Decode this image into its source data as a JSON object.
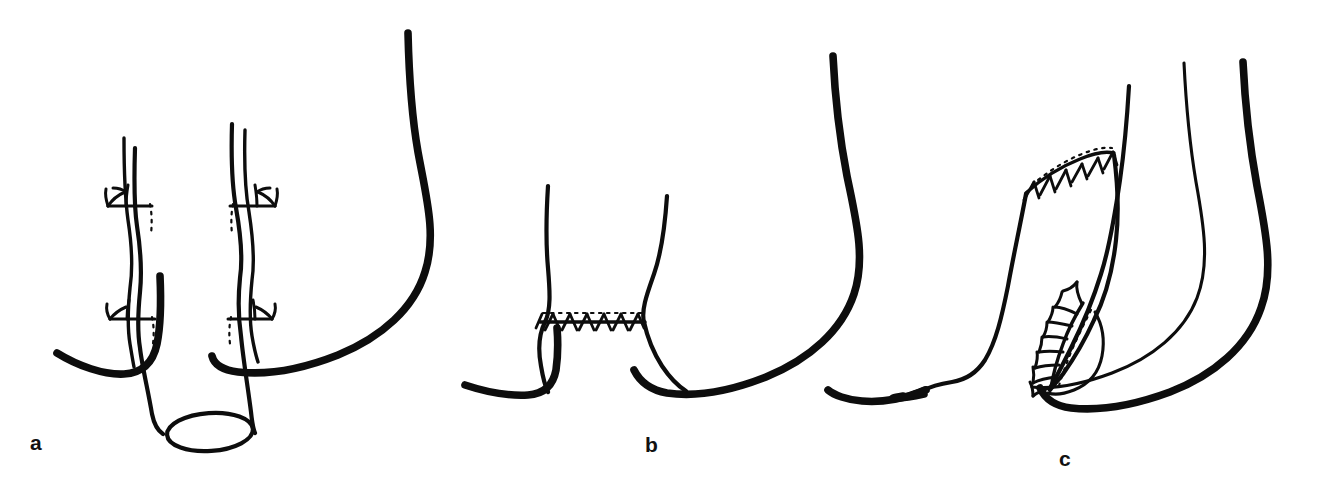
{
  "figure": {
    "background_color": "#ffffff",
    "ink_color": "#0d0d0d",
    "width": 1317,
    "height": 490,
    "style": "black ink line drawing, no shading"
  },
  "panels": [
    {
      "id": "a",
      "label": "a",
      "label_x": 30,
      "label_y": 450,
      "caption_stage": "Mobilised tube with divided vascular pedicles and open cut end",
      "elements": [
        "open-cut-end-ellipse",
        "tube-left-wall",
        "tube-right-wall",
        "vessel-left-long",
        "vessel-right-long",
        "ligature-upper-left",
        "ligature-upper-right",
        "ligature-lower-left",
        "ligature-lower-right",
        "thick-organ-contour-left",
        "thick-organ-contour-right"
      ]
    },
    {
      "id": "b",
      "label": "b",
      "label_x": 645,
      "label_y": 452,
      "caption_stage": "Closed stump joined by transverse running suture line",
      "elements": [
        "limb-left-wall",
        "limb-right-wall",
        "transverse-suture-line",
        "thick-organ-contour-left",
        "thick-organ-contour-right"
      ]
    },
    {
      "id": "c",
      "label": "c",
      "label_x": 1059,
      "label_y": 466,
      "caption_stage": "Completed pouch with oblique suture line and preserved vascular arcade",
      "elements": [
        "pouch-outer-wall",
        "pouch-inner-wall",
        "oblique-suture-line",
        "vascular-arcade",
        "arcade-branches",
        "thin-organ-contour",
        "thick-organ-contour"
      ]
    }
  ],
  "suture_lines": [
    {
      "name": "transverse-suture-line",
      "panel": "b",
      "orientation": "horizontal",
      "stitch_count": 7,
      "start": [
        540,
        322
      ],
      "end": [
        644,
        322
      ]
    },
    {
      "name": "oblique-suture-line",
      "panel": "c",
      "orientation": "oblique-ascending",
      "stitch_count": 8,
      "start": [
        1028,
        190
      ],
      "end": [
        1113,
        153
      ]
    }
  ],
  "ligatures": [
    {
      "name": "ligature-upper-left",
      "panel": "a",
      "x": 135,
      "y": 206,
      "side": "left"
    },
    {
      "name": "ligature-upper-right",
      "panel": "a",
      "x": 252,
      "y": 206,
      "side": "right"
    },
    {
      "name": "ligature-lower-left",
      "panel": "a",
      "x": 136,
      "y": 318,
      "side": "left"
    },
    {
      "name": "ligature-lower-right",
      "panel": "a",
      "x": 249,
      "y": 318,
      "side": "right"
    }
  ],
  "vascular_arcade": {
    "panel": "c",
    "name": "vascular-arcade",
    "branch_count": 9,
    "description": "feathered mesenteric vessel arcade running down the pedicle"
  },
  "cut_end": {
    "panel": "a",
    "name": "open-cut-end-ellipse",
    "center": [
      210,
      432
    ],
    "radius_x": 43,
    "radius_y": 19,
    "rotation_deg": -4
  }
}
